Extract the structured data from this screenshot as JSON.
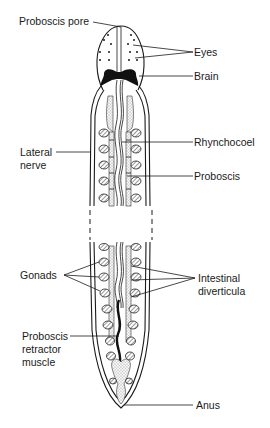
{
  "labels": {
    "proboscis_pore": "Proboscis pore",
    "eyes": "Eyes",
    "brain": "Brain",
    "rhynchocoel": "Rhynchocoel",
    "lateral_nerve_1": "Lateral",
    "lateral_nerve_2": "nerve",
    "proboscis": "Proboscis",
    "gonads": "Gonads",
    "intestinal_1": "Intestinal",
    "intestinal_2": "diverticula",
    "retractor_1": "Proboscis",
    "retractor_2": "retractor",
    "retractor_3": "muscle",
    "anus": "Anus"
  }
}
